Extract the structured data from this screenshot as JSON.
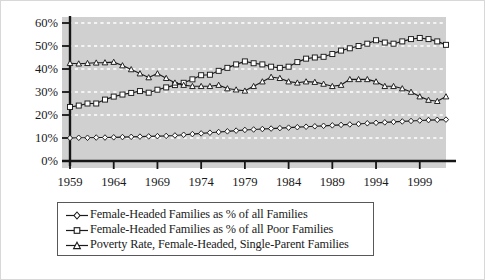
{
  "chart_data": {
    "type": "line",
    "title": "",
    "subtitle": "",
    "xlabel": "",
    "ylabel": "",
    "xlim": [
      1959,
      2002
    ],
    "ylim": [
      0,
      60
    ],
    "ytick_labels": [
      "0%",
      "10%",
      "20%",
      "30%",
      "40%",
      "50%",
      "60%"
    ],
    "ytick_values": [
      0,
      10,
      20,
      30,
      40,
      50,
      60
    ],
    "xtick_labels": [
      "1959",
      "1964",
      "1969",
      "1974",
      "1979",
      "1984",
      "1989",
      "1994",
      "1999"
    ],
    "xtick_values": [
      1959,
      1964,
      1969,
      1974,
      1979,
      1984,
      1989,
      1994,
      1999
    ],
    "grid": "horizontal-dashed-white",
    "legend_position": "below-plot",
    "plot_background": "#d0d0d0",
    "x": [
      1959,
      1960,
      1961,
      1962,
      1963,
      1964,
      1965,
      1966,
      1967,
      1968,
      1969,
      1970,
      1971,
      1972,
      1973,
      1974,
      1975,
      1976,
      1977,
      1978,
      1979,
      1980,
      1981,
      1982,
      1983,
      1984,
      1985,
      1986,
      1987,
      1988,
      1989,
      1990,
      1991,
      1992,
      1993,
      1994,
      1995,
      1996,
      1997,
      1998,
      1999,
      2000,
      2001,
      2002
    ],
    "series": [
      {
        "name": "Female-Headed Families as % of all Families",
        "marker": "diamond",
        "color": "#1a1a1a",
        "values": [
          10.0,
          10.1,
          10.1,
          10.2,
          10.2,
          10.3,
          10.4,
          10.5,
          10.6,
          10.7,
          10.8,
          10.9,
          11.1,
          11.4,
          11.7,
          12.0,
          12.3,
          12.6,
          12.9,
          13.2,
          13.5,
          13.7,
          13.9,
          14.1,
          14.3,
          14.5,
          14.7,
          14.9,
          15.1,
          15.3,
          15.5,
          15.7,
          15.9,
          16.1,
          16.4,
          16.6,
          16.8,
          17.0,
          17.2,
          17.4,
          17.6,
          17.8,
          17.9,
          18.0
        ]
      },
      {
        "name": "Female-Headed Families as % of all Poor Families",
        "marker": "square",
        "color": "#1a1a1a",
        "values": [
          23.5,
          24.1,
          25.0,
          25.0,
          26.7,
          28.0,
          28.9,
          29.6,
          30.4,
          29.7,
          31.0,
          32.0,
          33.0,
          34.0,
          35.5,
          37.3,
          37.5,
          39.2,
          40.5,
          42.0,
          43.3,
          42.5,
          42.0,
          41.0,
          40.5,
          41.0,
          43.0,
          44.5,
          45.0,
          45.3,
          46.5,
          48.0,
          49.0,
          50.0,
          51.0,
          52.5,
          51.5,
          51.0,
          52.0,
          53.0,
          53.5,
          53.0,
          52.0,
          50.5
        ]
      },
      {
        "name": "Poverty Rate, Female-Headed, Single-Parent Families",
        "marker": "triangle",
        "color": "#1a1a1a",
        "values": [
          42.5,
          42.3,
          42.5,
          42.7,
          42.8,
          43.0,
          41.5,
          39.8,
          38.0,
          36.3,
          38.0,
          36.0,
          34.0,
          33.0,
          32.5,
          32.5,
          32.5,
          33.0,
          31.5,
          31.0,
          30.5,
          32.5,
          34.5,
          36.5,
          36.0,
          34.5,
          34.0,
          34.5,
          34.3,
          33.5,
          32.5,
          33.0,
          35.5,
          35.5,
          35.5,
          34.5,
          32.5,
          32.5,
          31.5,
          30.0,
          28.0,
          26.5,
          26.0,
          28.0
        ]
      }
    ]
  },
  "legend": {
    "items": [
      {
        "label": "Female-Headed Families as % of all Families",
        "marker": "diamond"
      },
      {
        "label": "Female-Headed Families as % of all Poor Families",
        "marker": "square"
      },
      {
        "label": "Poverty Rate, Female-Headed, Single-Parent Families",
        "marker": "triangle"
      }
    ]
  }
}
